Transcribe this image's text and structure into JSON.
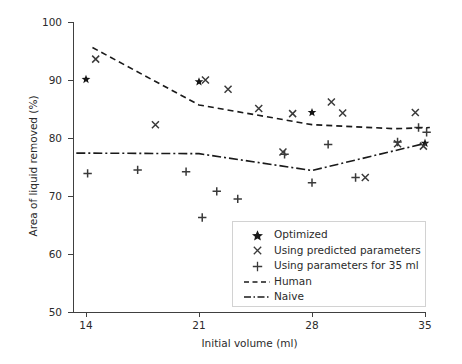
{
  "chart_data": {
    "type": "scatter",
    "title": "",
    "xlabel": "Initial volume (ml)",
    "ylabel": "Area of liquid removed (%)",
    "xlim": [
      12.8,
      36.5
    ],
    "ylim": [
      50,
      100
    ],
    "xticks": [
      14,
      21,
      28,
      35
    ],
    "yticks": [
      50,
      60,
      70,
      80,
      90,
      100
    ],
    "grid": false,
    "legend_position": "lower right",
    "series": [
      {
        "name": "Optimized",
        "marker": "star",
        "points": [
          {
            "x": 14.0,
            "y": 90.1
          },
          {
            "x": 21.0,
            "y": 89.7
          },
          {
            "x": 28.0,
            "y": 84.4
          },
          {
            "x": 35.0,
            "y": 79.1
          }
        ]
      },
      {
        "name": "Using predicted parameters",
        "marker": "x",
        "points": [
          {
            "x": 14.6,
            "y": 93.6
          },
          {
            "x": 18.3,
            "y": 82.3
          },
          {
            "x": 21.4,
            "y": 90.0
          },
          {
            "x": 22.8,
            "y": 88.4
          },
          {
            "x": 24.7,
            "y": 85.1
          },
          {
            "x": 26.2,
            "y": 77.6
          },
          {
            "x": 26.8,
            "y": 84.2
          },
          {
            "x": 29.2,
            "y": 86.2
          },
          {
            "x": 29.9,
            "y": 84.3
          },
          {
            "x": 31.3,
            "y": 73.2
          },
          {
            "x": 33.3,
            "y": 79.0
          },
          {
            "x": 34.4,
            "y": 84.4
          },
          {
            "x": 34.9,
            "y": 78.6
          }
        ]
      },
      {
        "name": "Using parameters for 35 ml",
        "marker": "plus",
        "points": [
          {
            "x": 14.1,
            "y": 73.9
          },
          {
            "x": 17.2,
            "y": 74.5
          },
          {
            "x": 20.2,
            "y": 74.2
          },
          {
            "x": 21.2,
            "y": 66.3
          },
          {
            "x": 22.1,
            "y": 70.8
          },
          {
            "x": 23.4,
            "y": 69.5
          },
          {
            "x": 26.3,
            "y": 77.2
          },
          {
            "x": 28.0,
            "y": 72.3
          },
          {
            "x": 29.0,
            "y": 78.9
          },
          {
            "x": 30.7,
            "y": 73.2
          },
          {
            "x": 33.3,
            "y": 79.3
          },
          {
            "x": 34.6,
            "y": 81.8
          },
          {
            "x": 35.1,
            "y": 81.0
          }
        ]
      },
      {
        "name": "Human",
        "marker": "none",
        "linestyle": "dashed",
        "points": [
          {
            "x": 14.4,
            "y": 95.6
          },
          {
            "x": 21.0,
            "y": 85.7
          },
          {
            "x": 28.0,
            "y": 82.3
          },
          {
            "x": 33.1,
            "y": 81.6
          },
          {
            "x": 35.3,
            "y": 81.8
          }
        ]
      },
      {
        "name": "Naive",
        "marker": "none",
        "linestyle": "dashdot",
        "points": [
          {
            "x": 13.4,
            "y": 77.4
          },
          {
            "x": 21.0,
            "y": 77.3
          },
          {
            "x": 28.0,
            "y": 74.4
          },
          {
            "x": 35.2,
            "y": 79.2
          }
        ]
      }
    ]
  },
  "legend": {
    "items": [
      {
        "label": "Optimized",
        "marker": "star"
      },
      {
        "label": "Using predicted parameters",
        "marker": "x"
      },
      {
        "label": "Using parameters for 35 ml",
        "marker": "plus"
      },
      {
        "label": "Human",
        "marker": "dashed-line"
      },
      {
        "label": "Naive",
        "marker": "dashdot-line"
      }
    ]
  },
  "axes": {
    "x": {
      "label": "Initial volume (ml)",
      "ticks": [
        "14",
        "21",
        "28",
        "35"
      ]
    },
    "y": {
      "label": "Area of liquid removed (%)",
      "ticks": [
        "100",
        "90",
        "80",
        "70",
        "60",
        "50"
      ]
    }
  },
  "colors": {
    "marker": "#1a1a1a",
    "axis": "#404040",
    "text": "#2b2b2b",
    "background": "#ffffff"
  }
}
